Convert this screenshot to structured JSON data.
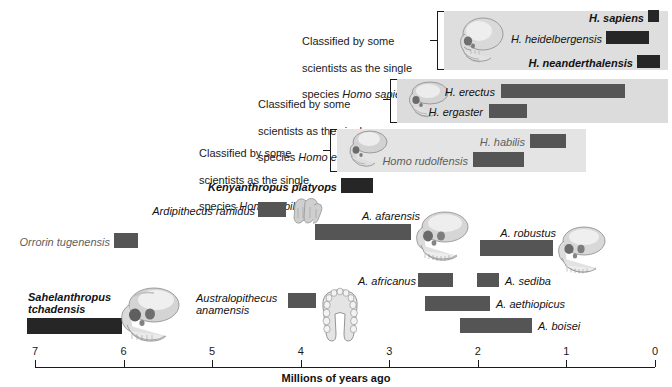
{
  "axis": {
    "title": "Millions of years ago",
    "ticks": [
      {
        "label": "7",
        "value": 7
      },
      {
        "label": "6",
        "value": 6
      },
      {
        "label": "5",
        "value": 5
      },
      {
        "label": "4",
        "value": 4
      },
      {
        "label": "3",
        "value": 3
      },
      {
        "label": "2",
        "value": 2
      },
      {
        "label": "1",
        "value": 1
      },
      {
        "label": "0",
        "value": 0
      }
    ],
    "min": 0,
    "max": 7.4
  },
  "annotations": [
    {
      "id": "homo-sapiens-group",
      "text": "Classified by some\nscientists as the single\nspecies Homo sapiens",
      "italic_part": "Homo sapiens"
    },
    {
      "id": "homo-erectus-group",
      "text": "Classified by some\nscientists as the single\nspecies Homo erectus",
      "italic_part": "Homo erectus"
    },
    {
      "id": "homo-habilis-group",
      "text": "Classified by some\nscientists as the single\nspecies Homo habilis",
      "italic_part": "Homo habilis"
    }
  ],
  "chart_data": {
    "type": "bar",
    "xlabel": "Millions of years ago",
    "ylabel": "",
    "xlim": [
      7.4,
      0
    ],
    "axis_direction": "reversed",
    "grid": false,
    "legend": false,
    "bars": [
      {
        "name": "H. sapiens",
        "start_mya": 0.2,
        "end_mya": 0.0,
        "label_align": "right",
        "bold": true,
        "shade": "dark"
      },
      {
        "name": "H. heidelbergensis",
        "start_mya": 0.7,
        "end_mya": 0.2,
        "label_align": "right",
        "bold": false,
        "shade": "dark"
      },
      {
        "name": "H. neanderthalensis",
        "start_mya": 0.35,
        "end_mya": 0.03,
        "label_align": "right",
        "bold": true,
        "shade": "dark"
      },
      {
        "name": "H. erectus",
        "start_mya": 1.8,
        "end_mya": 0.4,
        "label_align": "right",
        "bold": false,
        "shade": "mid"
      },
      {
        "name": "H. ergaster",
        "start_mya": 1.9,
        "end_mya": 1.5,
        "label_align": "right",
        "bold": false,
        "shade": "mid"
      },
      {
        "name": "H. habilis",
        "start_mya": 1.5,
        "end_mya": 1.1,
        "label_align": "right",
        "bold": false,
        "shade": "mid"
      },
      {
        "name": "Homo rudolfensis",
        "start_mya": 2.1,
        "end_mya": 1.55,
        "label_align": "right",
        "bold": false,
        "shade": "mid"
      },
      {
        "name": "Kenyanthropus platyops",
        "start_mya": 3.5,
        "end_mya": 3.15,
        "label_align": "right",
        "bold": true,
        "shade": "dark"
      },
      {
        "name": "Ardipithecus ramidus",
        "start_mya": 4.45,
        "end_mya": 4.15,
        "label_align": "right",
        "bold": false,
        "shade": "mid"
      },
      {
        "name": "A. afarensis",
        "start_mya": 3.85,
        "end_mya": 2.8,
        "label_align": "right",
        "bold": false,
        "shade": "mid"
      },
      {
        "name": "A. robustus",
        "start_mya": 2.0,
        "end_mya": 1.15,
        "label_align": "right",
        "bold": false,
        "shade": "mid"
      },
      {
        "name": "Orrorin tugenensis",
        "start_mya": 6.15,
        "end_mya": 5.9,
        "label_align": "right",
        "bold": false,
        "shade": "mid"
      },
      {
        "name": "A. africanus",
        "start_mya": 3.15,
        "end_mya": 2.8,
        "label_align": "right",
        "bold": false,
        "shade": "mid"
      },
      {
        "name": "A. sediba",
        "start_mya": 2.5,
        "end_mya": 2.25,
        "label_align": "left",
        "bold": false,
        "shade": "mid"
      },
      {
        "name": "A. aethiopicus",
        "start_mya": 3.05,
        "end_mya": 2.35,
        "label_align": "left",
        "bold": false,
        "shade": "mid"
      },
      {
        "name": "A. boisei",
        "start_mya": 2.45,
        "end_mya": 1.65,
        "label_align": "left",
        "bold": false,
        "shade": "mid"
      },
      {
        "name": "Sahelanthropus tchadensis",
        "start_mya": 7.15,
        "end_mya": 6.1,
        "label_align": "right",
        "bold": true,
        "shade": "dark"
      },
      {
        "name": "Australopithecus anamensis",
        "start_mya": 4.3,
        "end_mya": 4.0,
        "label_align": "right",
        "bold": false,
        "shade": "mid"
      }
    ]
  },
  "species": {
    "h_sapiens": "H. sapiens",
    "h_heidelbergensis": "H. heidelbergensis",
    "h_neanderthalensis": "H. neanderthalensis",
    "h_erectus": "H. erectus",
    "h_ergaster": "H. ergaster",
    "h_habilis": "H. habilis",
    "homo_rudolfensis": "Homo rudolfensis",
    "kenyanthropus_platyops": "Kenyanthropus platyops",
    "ardipithecus_ramidus": "Ardipithecus ramidus",
    "a_afarensis": "A. afarensis",
    "a_robustus": "A. robustus",
    "orrorin_tugenensis": "Orrorin tugenensis",
    "a_africanus": "A. africanus",
    "a_sediba": "A. sediba",
    "a_aethiopicus": "A. aethiopicus",
    "a_boisei": "A. boisei",
    "sahelanthropus_tchadensis": "Sahelanthropus\ntchadensis",
    "australopithecus_anamensis": "Australopithecus\nanamensis"
  },
  "annot_text": {
    "sapiens_l1": "Classified by some",
    "sapiens_l2": "scientists as the single",
    "sapiens_l3": "species ",
    "sapiens_l3i": "Homo sapiens",
    "erectus_l1": "Classified by some",
    "erectus_l2": "scientists as the single",
    "erectus_l3": "species ",
    "erectus_l3i": "Homo erectus",
    "habilis_l1": "Classified by some",
    "habilis_l2": "scientists as the single",
    "habilis_l3": "species ",
    "habilis_l3i": "Homo habilis"
  },
  "colors": {
    "bar_dark": "#262626",
    "bar_mid": "#555555",
    "group_bg": "#dedede",
    "axis": "#1a1a1a"
  }
}
